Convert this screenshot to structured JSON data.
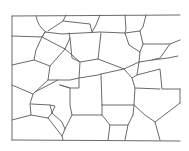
{
  "image": {
    "title": "Flagstone wall sketch",
    "description": "Pencil line drawing of an irregular flagstone / stone wall pattern",
    "stroke_color": "#6a6a6a",
    "background_color": "#ffffff"
  },
  "paths": [
    "M12,16 L180,15",
    "M12,16 L12,140",
    "M12,140 L180,141",
    "M12,36 L42,37 L45,32 L62,34 L100,32 L125,33 L140,31",
    "M36,16 Q38,27 46,32",
    "M66,15 L63,21 L48,31",
    "M63,21 L90,24 L92,32",
    "M100,15 L96,25 L92,32",
    "M125,15 L126,29 L125,33",
    "M146,15 L143,27 L140,31",
    "M42,37 L36,50 L34,60 L50,66",
    "M12,65 L34,60",
    "M45,32 L42,37 L65,49 L70,38 L69,33",
    "M65,49 L50,66 L48,80",
    "M70,38 L72,58 L80,62 L98,59 L101,33",
    "M65,49 L80,62 L79,78 L70,80 L58,80 L48,80",
    "M125,33 L129,45 L140,52 L139,62",
    "M140,31 L143,44 L140,52",
    "M143,44 L170,44 L180,40",
    "M170,44 L160,58 L152,60",
    "M139,62 L152,60 L168,58 L178,56",
    "M98,59 L124,69 L139,62",
    "M124,69 L132,78 L137,75 L139,62",
    "M79,78 L98,75 L101,74 L124,69",
    "M101,74 L102,105",
    "M79,78 L79,88 L70,88 L60,85",
    "M12,85 L33,94 L48,80",
    "M33,94 L30,104 L31,115",
    "M58,80 L35,92",
    "M60,85 L70,88 L70,105 L72,115 L102,115 L102,105",
    "M132,78 L135,88 L134,105 L133,115",
    "M137,75 L160,69 L162,89 L180,89",
    "M135,88 L160,89",
    "M134,105 L102,105",
    "M31,104 L50,105 L52,113 L48,118",
    "M50,105 L55,106 L52,113",
    "M12,120 L31,115 L48,118 L62,136 L63,140",
    "M72,115 L65,129 L62,136",
    "M52,113 L62,122 L65,129",
    "M102,115 L110,125 L108,140",
    "M133,115 L128,125 L110,125",
    "M134,105 L145,115 L155,122 L180,103",
    "M155,122 L160,140",
    "M180,89 L180,103",
    "M128,125 L125,140"
  ]
}
